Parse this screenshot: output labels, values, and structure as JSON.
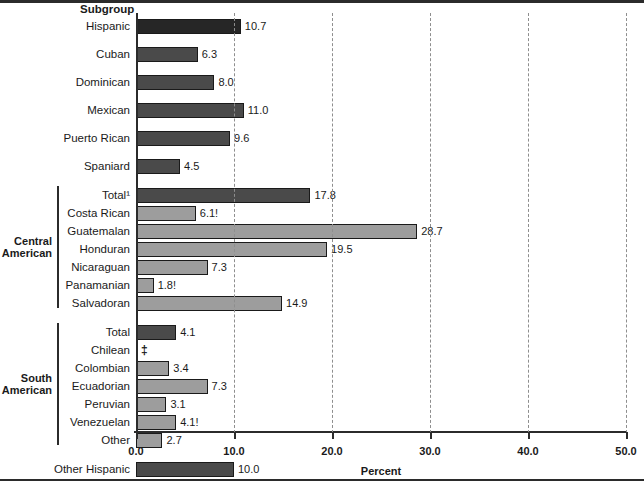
{
  "figure": {
    "subgroup_title": "Subgroup",
    "xaxis_title": "Percent"
  },
  "chart_data": {
    "type": "bar",
    "orientation": "horizontal",
    "title": "Subgroup",
    "xlabel": "Percent",
    "ylabel": "Subgroup",
    "xlim": [
      0.0,
      50.0
    ],
    "grid": true,
    "gridlines_dashed": true,
    "legend": null,
    "tick_labels": [
      "0.0",
      "10.0",
      "20.0",
      "30.0",
      "40.0",
      "50.0"
    ],
    "ticks": [
      0,
      10,
      20,
      30,
      40,
      50
    ],
    "footnote_markers": {
      "superscript_1": "Total¹",
      "unreliable": "!",
      "suppressed": "‡"
    },
    "categories": [
      "Hispanic",
      "Cuban",
      "Dominican",
      "Mexican",
      "Puerto Rican",
      "Spaniard",
      "Total¹",
      "Costa Rican",
      "Guatemalan",
      "Honduran",
      "Nicaraguan",
      "Panamanian",
      "Salvadoran",
      "Total",
      "Chilean",
      "Colombian",
      "Ecuadorian",
      "Peruvian",
      "Venezuelan",
      "Other",
      "Other Hispanic"
    ],
    "values": [
      10.7,
      6.3,
      8.0,
      11.0,
      9.6,
      4.5,
      17.8,
      6.1,
      28.7,
      19.5,
      7.3,
      1.8,
      14.9,
      4.1,
      null,
      3.4,
      7.3,
      3.1,
      4.1,
      2.7,
      10.0
    ],
    "value_labels": [
      "10.7",
      "6.3",
      "8.0",
      "11.0",
      "9.6",
      "4.5",
      "17.8",
      "6.1!",
      "28.7",
      "19.5",
      "7.3",
      "1.8!",
      "14.9",
      "4.1",
      "‡",
      "3.4",
      "7.3",
      "3.1",
      "4.1!",
      "2.7",
      "10.0"
    ]
  },
  "rows": [
    {
      "label": "Hispanic",
      "value": 10.7,
      "value_label": "10.7",
      "color": "#262626",
      "top": 16,
      "suppressed": false
    },
    {
      "label": "Cuban",
      "value": 6.3,
      "value_label": "6.3",
      "color": "#4a4a4a",
      "top": 44,
      "suppressed": false
    },
    {
      "label": "Dominican",
      "value": 8.0,
      "value_label": "8.0",
      "color": "#4a4a4a",
      "top": 72,
      "suppressed": false
    },
    {
      "label": "Mexican",
      "value": 11.0,
      "value_label": "11.0",
      "color": "#4a4a4a",
      "top": 100,
      "suppressed": false
    },
    {
      "label": "Puerto Rican",
      "value": 9.6,
      "value_label": "9.6",
      "color": "#4a4a4a",
      "top": 128,
      "suppressed": false
    },
    {
      "label": "Spaniard",
      "value": 4.5,
      "value_label": "4.5",
      "color": "#4a4a4a",
      "top": 156,
      "suppressed": false
    },
    {
      "label": "Total¹",
      "value": 17.8,
      "value_label": "17.8",
      "color": "#4a4a4a",
      "top": 185,
      "suppressed": false
    },
    {
      "label": "Costa Rican",
      "value": 6.1,
      "value_label": "6.1!",
      "color": "#9d9d9d",
      "top": 203,
      "suppressed": false
    },
    {
      "label": "Guatemalan",
      "value": 28.7,
      "value_label": "28.7",
      "color": "#9d9d9d",
      "top": 221,
      "suppressed": false
    },
    {
      "label": "Honduran",
      "value": 19.5,
      "value_label": "19.5",
      "color": "#9d9d9d",
      "top": 239,
      "suppressed": false
    },
    {
      "label": "Nicaraguan",
      "value": 7.3,
      "value_label": "7.3",
      "color": "#9d9d9d",
      "top": 257,
      "suppressed": false
    },
    {
      "label": "Panamanian",
      "value": 1.8,
      "value_label": "1.8!",
      "color": "#9d9d9d",
      "top": 275,
      "suppressed": false
    },
    {
      "label": "Salvadoran",
      "value": 14.9,
      "value_label": "14.9",
      "color": "#9d9d9d",
      "top": 293,
      "suppressed": false
    },
    {
      "label": "Total",
      "value": 4.1,
      "value_label": "4.1",
      "color": "#4a4a4a",
      "top": 322,
      "suppressed": false
    },
    {
      "label": "Chilean",
      "value": 0,
      "value_label": "‡",
      "color": "#9d9d9d",
      "top": 340,
      "suppressed": true
    },
    {
      "label": "Colombian",
      "value": 3.4,
      "value_label": "3.4",
      "color": "#9d9d9d",
      "top": 358,
      "suppressed": false
    },
    {
      "label": "Ecuadorian",
      "value": 7.3,
      "value_label": "7.3",
      "color": "#9d9d9d",
      "top": 376,
      "suppressed": false
    },
    {
      "label": "Peruvian",
      "value": 3.1,
      "value_label": "3.1",
      "color": "#9d9d9d",
      "top": 394,
      "suppressed": false
    },
    {
      "label": "Venezuelan",
      "value": 4.1,
      "value_label": "4.1!",
      "color": "#9d9d9d",
      "top": 412,
      "suppressed": false
    },
    {
      "label": "Other",
      "value": 2.7,
      "value_label": "2.7",
      "color": "#9d9d9d",
      "top": 430,
      "suppressed": false
    },
    {
      "label": "Other Hispanic",
      "value": 10.0,
      "value_label": "10.0",
      "color": "#4a4a4a",
      "top": 459,
      "suppressed": false
    }
  ],
  "groups": [
    {
      "label_line1": "Central",
      "label_line2": "American",
      "top": 185,
      "height": 122
    },
    {
      "label_line1": "South",
      "label_line2": "American",
      "top": 322,
      "height": 122
    }
  ],
  "axis": {
    "ticks": [
      {
        "label": "0.0",
        "value": 0
      },
      {
        "label": "10.0",
        "value": 10
      },
      {
        "label": "20.0",
        "value": 20
      },
      {
        "label": "30.0",
        "value": 30
      },
      {
        "label": "40.0",
        "value": 40
      },
      {
        "label": "50.0",
        "value": 50
      }
    ]
  }
}
